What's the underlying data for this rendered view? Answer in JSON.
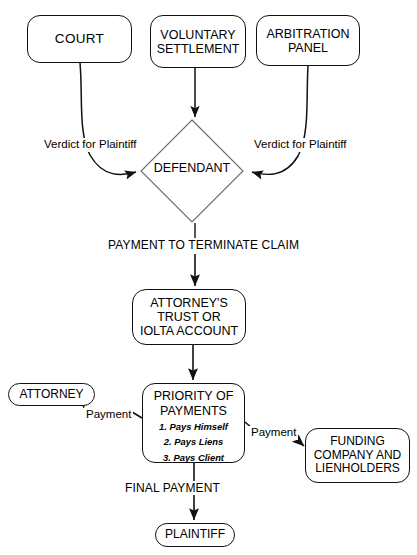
{
  "diagram": {
    "background_color": "#ffffff",
    "line_color": "#111111",
    "nodes": {
      "court": {
        "label": "COURT",
        "shape": "rounded-rect"
      },
      "voluntary_settlement": {
        "line1": "VOLUNTARY",
        "line2": "SETTLEMENT",
        "shape": "rounded-rect"
      },
      "arbitration_panel": {
        "line1": "ARBITRATION",
        "line2": "PANEL",
        "shape": "rounded-rect"
      },
      "defendant": {
        "label": "DEFENDANT",
        "shape": "diamond"
      },
      "trust_account": {
        "line1": "ATTORNEY'S",
        "line2": "TRUST OR",
        "line3": "IOLTA ACCOUNT",
        "shape": "rounded-rect"
      },
      "priority_of_payments": {
        "line1": "PRIORITY OF",
        "line2": "PAYMENTS",
        "items": [
          "1. Pays Himself",
          "2. Pays Liens",
          "3. Pays Client"
        ],
        "shape": "rounded-rect"
      },
      "attorney": {
        "label": "ATTORNEY",
        "shape": "pill"
      },
      "funding_company": {
        "line1": "FUNDING",
        "line2": "COMPANY AND",
        "line3": "LIENHOLDERS",
        "shape": "rounded-rect"
      },
      "plaintiff": {
        "label": "PLAINTIFF",
        "shape": "pill"
      }
    },
    "edge_labels": {
      "verdict_left": "Verdict for Plaintiff",
      "verdict_right": "Verdict for Plaintiff",
      "payment_to_terminate": "PAYMENT TO TERMINATE CLAIM",
      "payment_left": "Payment",
      "payment_right": "Payment",
      "final_payment": "FINAL PAYMENT"
    },
    "edges": [
      {
        "from": "court",
        "to": "defendant",
        "label": "Verdict for Plaintiff",
        "style": "curved-arrow"
      },
      {
        "from": "voluntary_settlement",
        "to": "defendant",
        "label": "",
        "style": "straight-arrow"
      },
      {
        "from": "arbitration_panel",
        "to": "defendant",
        "label": "Verdict for Plaintiff",
        "style": "curved-arrow"
      },
      {
        "from": "defendant",
        "to": "trust_account",
        "label": "PAYMENT TO TERMINATE CLAIM",
        "style": "straight-arrow"
      },
      {
        "from": "trust_account",
        "to": "priority_of_payments",
        "label": "",
        "style": "straight-arrow"
      },
      {
        "from": "priority_of_payments",
        "to": "attorney",
        "label": "Payment",
        "style": "diagonal-arrow"
      },
      {
        "from": "priority_of_payments",
        "to": "funding_company",
        "label": "Payment",
        "style": "diagonal-arrow"
      },
      {
        "from": "priority_of_payments",
        "to": "plaintiff",
        "label": "FINAL PAYMENT",
        "style": "straight-arrow"
      }
    ]
  }
}
